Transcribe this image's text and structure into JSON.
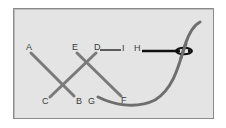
{
  "diagram": {
    "type": "stitching-diagram",
    "labels": {
      "A": "A",
      "B": "B",
      "C": "C",
      "D": "D",
      "E": "E",
      "F": "F",
      "G": "G",
      "H": "H",
      "I": "I"
    },
    "colors": {
      "background": "#e4e4e4",
      "border": "#8a8a8a",
      "stitch": "#7a7a7a",
      "thread": "#6e6e6e",
      "needle": "#111111",
      "label": "#3a3a3a"
    },
    "stitches": [
      {
        "from": "A",
        "to": "B"
      },
      {
        "from": "D",
        "to": "C"
      },
      {
        "from": "E",
        "to": "F"
      }
    ],
    "connectors": [
      {
        "from": "D",
        "to": "I"
      }
    ],
    "thread": {
      "from": "G",
      "through": "needle-eye"
    },
    "needle": {
      "point": "H"
    }
  }
}
